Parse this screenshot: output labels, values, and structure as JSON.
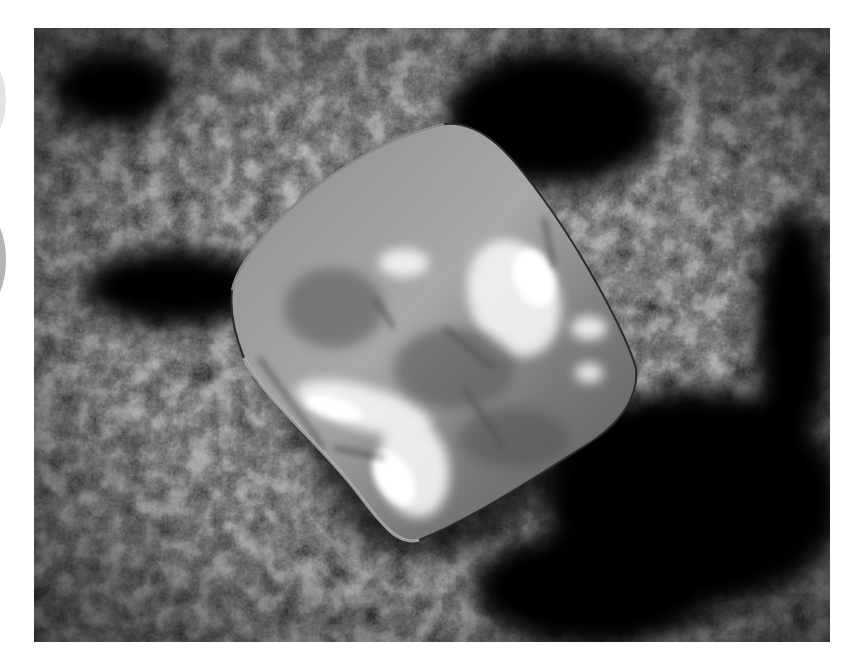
{
  "image": {
    "subject": "rough octahedral diamond crystal resting on dark granular rock",
    "tone": "grayscale",
    "colors": {
      "page_background": "#ffffff",
      "rock_dark": "#0a0a0a",
      "rock_mid": "#4a4a4a",
      "rock_light": "#8a8a8a",
      "crystal_body": "#9a9a9a",
      "crystal_highlight": "#f4f4f4",
      "margin_mark_light": "#e4e4e4",
      "margin_mark_dark": "#b4b4b4"
    },
    "photo_bounds": {
      "x": 34,
      "y": 28,
      "width": 796,
      "height": 614
    }
  }
}
